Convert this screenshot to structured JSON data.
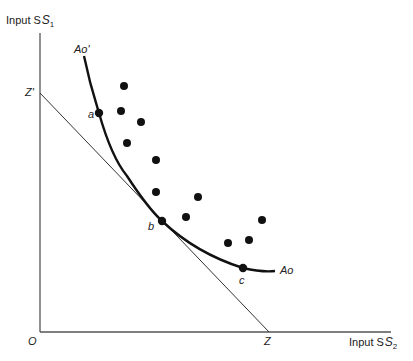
{
  "diagram": {
    "y_axis_label": "Input S",
    "y_axis_sub": "1",
    "x_axis_label": "Input S",
    "x_axis_sub": "2",
    "origin_label": "O",
    "intercept_y_label": "Z'",
    "intercept_x_label": "Z",
    "curve_start_label": "Ao'",
    "curve_end_label": "Ao",
    "point_labels": [
      "a",
      "b",
      "c"
    ],
    "colors": {
      "ink": "#1a1a1a",
      "axis": "#555555",
      "line": "#333333"
    }
  },
  "chart_data": {
    "type": "scatter",
    "title": "",
    "xlabel": "Input S2",
    "ylabel": "Input S1",
    "curves": [
      {
        "name": "Ao' - Ao (efficient isoquant)",
        "points_px": [
          [
            84,
            56
          ],
          [
            99,
            113
          ],
          [
            127,
            175
          ],
          [
            162,
            221
          ],
          [
            200,
            250
          ],
          [
            243,
            268
          ],
          [
            275,
            271
          ]
        ]
      }
    ],
    "lines": [
      {
        "name": "Z' - Z (isocost line)",
        "from_px": [
          40,
          93
        ],
        "to_px": [
          269,
          332
        ]
      }
    ],
    "labeled_points": [
      {
        "label": "a",
        "px": [
          99,
          113
        ]
      },
      {
        "label": "b",
        "px": [
          162,
          221
        ]
      },
      {
        "label": "c",
        "px": [
          243,
          268
        ]
      }
    ],
    "observations_px": [
      [
        124,
        86
      ],
      [
        121,
        111
      ],
      [
        141,
        122
      ],
      [
        127,
        143
      ],
      [
        156,
        160
      ],
      [
        156,
        192
      ],
      [
        198,
        197
      ],
      [
        186,
        217
      ],
      [
        228,
        243
      ],
      [
        249,
        240
      ],
      [
        262,
        220
      ]
    ]
  }
}
